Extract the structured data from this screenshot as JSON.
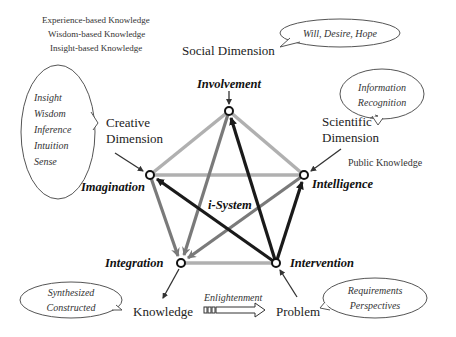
{
  "knowledge_types": [
    "Experience-based  Knowledge",
    "Wisdom-based  Knowledge",
    "Insight-based  Knowledge"
  ],
  "dimensions": {
    "social": "Social Dimension",
    "creative_line1": "Creative",
    "creative_line2": "Dimension",
    "scientific_line1": "Scientific",
    "scientific_line2": "Dimension",
    "public_knowledge": "Public Knowledge",
    "knowledge": "Knowledge",
    "problem": "Problem"
  },
  "nodes": {
    "involvement": "Involvement",
    "imagination": "Imagination",
    "intelligence": "Intelligence",
    "integration": "Integration",
    "intervention": "Intervention",
    "center": "i-System"
  },
  "bubbles": {
    "social": "Will, Desire, Hope",
    "scientific": [
      "Information",
      "Recognition"
    ],
    "creative": [
      "Insight",
      "Wisdom",
      "Inference",
      "Intuition",
      "Sense"
    ],
    "knowledge": [
      "Synthesized",
      "Constructed"
    ],
    "problem": [
      "Requirements",
      "Perspectives"
    ]
  },
  "enlightenment": "Enlightenment",
  "colors": {
    "dark_edge": "#1a1a1a",
    "medium_edge": "#7a7a7a",
    "light_edge": "#b0b0b0"
  }
}
